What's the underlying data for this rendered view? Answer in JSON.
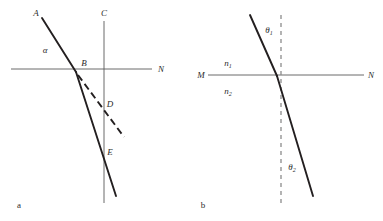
{
  "figure": {
    "background_color": "#ffffff",
    "ray_color": "#231f20",
    "axis_color": "#5a5a5a",
    "normal_color": "#8c8c8c",
    "label_color": "#2b2b2b"
  },
  "panels": [
    {
      "id": "a",
      "caption": "a",
      "labels": {
        "incident_ray_end": "A",
        "normal_top": "C",
        "interface_point": "B",
        "surface_right": "N",
        "angle_alpha": "α",
        "dashed_ray_point": "D",
        "solid_ray_point": "E"
      }
    },
    {
      "id": "b",
      "caption": "b",
      "labels": {
        "surface_left": "M",
        "surface_right": "N",
        "index_upper": "n",
        "index_upper_sub": "1",
        "index_lower": "n",
        "index_lower_sub": "2",
        "angle_incidence": "θ",
        "angle_incidence_sub": "1",
        "angle_refraction": "θ",
        "angle_refraction_sub": "2"
      }
    }
  ]
}
